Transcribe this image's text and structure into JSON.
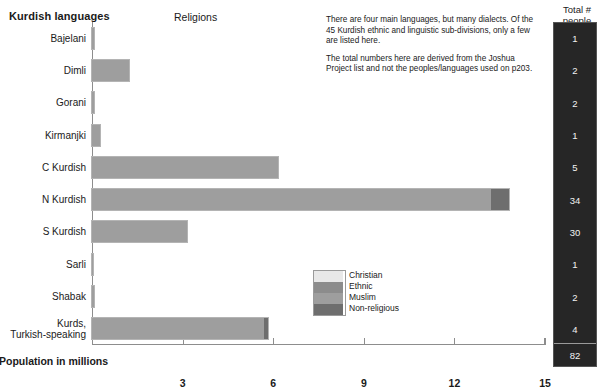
{
  "headers": {
    "left_title": "Kurdish languages",
    "religions_title": "Religions",
    "totals_title_line1": "Total #",
    "totals_title_line2": "people groups"
  },
  "notes": [
    "There are four main languages, but many dialects. Of the 45 Kurdish ethnic and linguistic sub-divisions, only a few are listed here.",
    "The total numbers here are derived from the Joshua Project list and not the peoples/languages used on p203."
  ],
  "legend": {
    "items": [
      {
        "label": "Christian",
        "color": "#e8e8e8"
      },
      {
        "label": "Ethnic",
        "color": "#8c8c8c"
      },
      {
        "label": "Muslim",
        "color": "#9e9e9e"
      },
      {
        "label": "Non-religious",
        "color": "#6e6e6e"
      }
    ]
  },
  "totals": {
    "values": [
      "1",
      "2",
      "2",
      "1",
      "5",
      "34",
      "30",
      "1",
      "2",
      "4"
    ],
    "sum": "82"
  },
  "chart_data": {
    "type": "bar",
    "orientation": "horizontal",
    "stacked": true,
    "title": "Kurdish languages",
    "xlabel": "Population in millions",
    "ylabel": "",
    "xlim": [
      0,
      15
    ],
    "xticks": [
      0,
      3,
      6,
      9,
      12,
      15
    ],
    "xticklabels": [
      "",
      "3",
      "6",
      "9",
      "12",
      "15"
    ],
    "grid": false,
    "legend_position": "inside-lower-center",
    "categories": [
      "Bajelani",
      "Dimli",
      "Gorani",
      "Kirmanjki",
      "C Kurdish",
      "N Kurdish",
      "S Kurdish",
      "Sarli",
      "Shabak",
      "Kurds,\nTurkish-speaking"
    ],
    "series": [
      {
        "name": "Christian",
        "color": "#e8e8e8",
        "values": [
          0,
          0,
          0,
          0,
          0,
          0,
          0,
          0,
          0,
          0
        ]
      },
      {
        "name": "Ethnic",
        "color": "#8c8c8c",
        "values": [
          0,
          0,
          0,
          0,
          0,
          0,
          0,
          0,
          0,
          0
        ]
      },
      {
        "name": "Muslim",
        "color": "#9e9e9e",
        "values": [
          0.07,
          1.22,
          0.05,
          0.25,
          6.15,
          13.2,
          3.15,
          0.04,
          0.06,
          5.7
        ]
      },
      {
        "name": "Non-religious",
        "color": "#6e6e6e",
        "values": [
          0,
          0,
          0,
          0,
          0,
          0.6,
          0,
          0,
          0,
          0.12
        ]
      }
    ],
    "totals_per_category": [
      0.07,
      1.22,
      0.05,
      0.25,
      6.15,
      13.8,
      3.15,
      0.04,
      0.06,
      5.82
    ],
    "people_groups": [
      1,
      2,
      2,
      1,
      5,
      34,
      30,
      1,
      2,
      4
    ],
    "people_groups_total": 82
  },
  "axis": {
    "xlabel": "Population in millions"
  }
}
